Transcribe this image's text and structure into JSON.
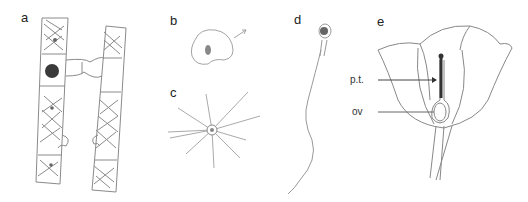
{
  "figure": {
    "panels": [
      {
        "id": "a",
        "label": "a",
        "subject": "spirogyra-conjugation-filaments"
      },
      {
        "id": "b",
        "label": "b",
        "subject": "amoeboid-gamete"
      },
      {
        "id": "c",
        "label": "c",
        "subject": "radiating-cell"
      },
      {
        "id": "d",
        "label": "d",
        "subject": "flagellated-sperm"
      },
      {
        "id": "e",
        "label": "e",
        "subject": "flower-longitudinal-section"
      }
    ],
    "annotations": [
      {
        "label": "p.t.",
        "target": "pollen-tube"
      },
      {
        "label": "ov",
        "target": "ovule"
      }
    ],
    "colors": {
      "line": "#8a8a8a",
      "dark": "#3a3a3a",
      "background": "#ffffff"
    }
  }
}
